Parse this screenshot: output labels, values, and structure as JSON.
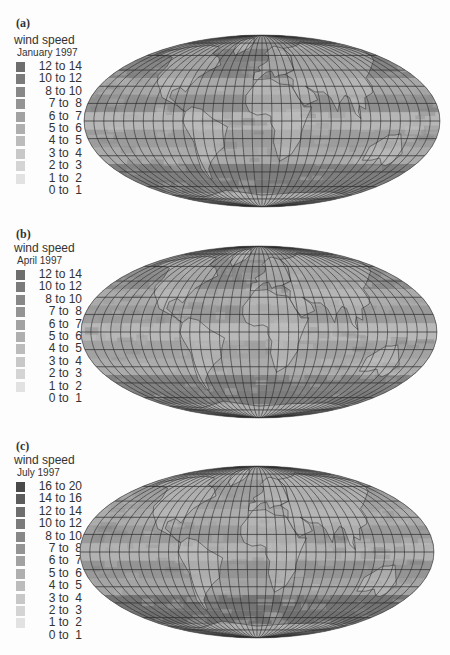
{
  "figure": {
    "panels": [
      {
        "label": "(a)",
        "legend_title": "wind speed",
        "legend_subtitle": "January 1997",
        "legend_items": [
          {
            "range": "12 to 14",
            "color": "#6e6e6e"
          },
          {
            "range": "10 to 12",
            "color": "#7b7b7b"
          },
          {
            "range": " 8 to 10",
            "color": "#888888"
          },
          {
            "range": " 7 to  8",
            "color": "#949494"
          },
          {
            "range": " 6 to  7",
            "color": "#a2a2a2"
          },
          {
            "range": " 5 to  6",
            "color": "#afafaf"
          },
          {
            "range": " 4 to  5",
            "color": "#bcbcbc"
          },
          {
            "range": " 3 to  4",
            "color": "#c8c8c8"
          },
          {
            "range": " 2 to  3",
            "color": "#d4d4d4"
          },
          {
            "range": " 1 to  2",
            "color": "#e2e2e2"
          },
          {
            "range": " 0 to  1",
            "color": "#fdfdfd"
          }
        ]
      },
      {
        "label": "(b)",
        "legend_title": "wind speed",
        "legend_subtitle": "April 1997",
        "legend_items": [
          {
            "range": "12 to 14",
            "color": "#6e6e6e"
          },
          {
            "range": "10 to 12",
            "color": "#7b7b7b"
          },
          {
            "range": " 8 to 10",
            "color": "#888888"
          },
          {
            "range": " 7 to  8",
            "color": "#949494"
          },
          {
            "range": " 6 to  7",
            "color": "#a2a2a2"
          },
          {
            "range": " 5 to  6",
            "color": "#afafaf"
          },
          {
            "range": " 4 to  5",
            "color": "#bcbcbc"
          },
          {
            "range": " 3 to  4",
            "color": "#c8c8c8"
          },
          {
            "range": " 2 to  3",
            "color": "#d4d4d4"
          },
          {
            "range": " 1 to  2",
            "color": "#e2e2e2"
          },
          {
            "range": " 0 to  1",
            "color": "#fdfdfd"
          }
        ]
      },
      {
        "label": "(c)",
        "legend_title": "wind speed",
        "legend_subtitle": "July 1997",
        "legend_items": [
          {
            "range": "16 to 20",
            "color": "#4a4a4a"
          },
          {
            "range": "14 to 16",
            "color": "#5c5c5c"
          },
          {
            "range": "12 to 14",
            "color": "#6e6e6e"
          },
          {
            "range": "10 to 12",
            "color": "#7b7b7b"
          },
          {
            "range": " 8 to 10",
            "color": "#888888"
          },
          {
            "range": " 7 to  8",
            "color": "#949494"
          },
          {
            "range": " 6 to  7",
            "color": "#a2a2a2"
          },
          {
            "range": " 5 to  6",
            "color": "#afafaf"
          },
          {
            "range": " 4 to  5",
            "color": "#bcbcbc"
          },
          {
            "range": " 3 to  4",
            "color": "#c8c8c8"
          },
          {
            "range": " 2 to  3",
            "color": "#d4d4d4"
          },
          {
            "range": " 1 to  2",
            "color": "#e2e2e2"
          },
          {
            "range": " 0 to  1",
            "color": "#fdfdfd"
          }
        ]
      }
    ]
  },
  "maps": [
    {
      "month": "January 1997",
      "projection": "Mollweide world map",
      "cx": 262,
      "cy": 121,
      "rx": 178,
      "ry": 86,
      "bands": [
        {
          "lat": 75,
          "color": "#9a9a9a"
        },
        {
          "lat": 60,
          "color": "#7e7e7e"
        },
        {
          "lat": 45,
          "color": "#858585"
        },
        {
          "lat": 30,
          "color": "#a8a8a8"
        },
        {
          "lat": 15,
          "color": "#8f8f8f"
        },
        {
          "lat": 0,
          "color": "#b6b6b6"
        },
        {
          "lat": -15,
          "color": "#9c9c9c"
        },
        {
          "lat": -30,
          "color": "#aaaaaa"
        },
        {
          "lat": -45,
          "color": "#7e7e7e"
        },
        {
          "lat": -60,
          "color": "#7a7a7a"
        },
        {
          "lat": -75,
          "color": "#9a9a9a"
        }
      ]
    },
    {
      "month": "April 1997",
      "projection": "Mollweide world map",
      "cx": 259,
      "cy": 332,
      "rx": 178,
      "ry": 86,
      "bands": [
        {
          "lat": 75,
          "color": "#a0a0a0"
        },
        {
          "lat": 60,
          "color": "#8e8e8e"
        },
        {
          "lat": 45,
          "color": "#8a8a8a"
        },
        {
          "lat": 30,
          "color": "#aaaaaa"
        },
        {
          "lat": 15,
          "color": "#9a9a9a"
        },
        {
          "lat": 0,
          "color": "#b8b8b8"
        },
        {
          "lat": -15,
          "color": "#a2a2a2"
        },
        {
          "lat": -30,
          "color": "#ababab"
        },
        {
          "lat": -45,
          "color": "#828282"
        },
        {
          "lat": -60,
          "color": "#7c7c7c"
        },
        {
          "lat": -75,
          "color": "#9c9c9c"
        }
      ]
    },
    {
      "month": "July 1997",
      "projection": "Mollweide world map",
      "cx": 257,
      "cy": 552,
      "rx": 177,
      "ry": 86,
      "bands": [
        {
          "lat": 75,
          "color": "#a8a8a8"
        },
        {
          "lat": 60,
          "color": "#9c9c9c"
        },
        {
          "lat": 45,
          "color": "#a0a0a0"
        },
        {
          "lat": 30,
          "color": "#acacac"
        },
        {
          "lat": 15,
          "color": "#9a9a9a"
        },
        {
          "lat": 0,
          "color": "#b2b2b2"
        },
        {
          "lat": -15,
          "color": "#949494"
        },
        {
          "lat": -30,
          "color": "#a4a4a4"
        },
        {
          "lat": -45,
          "color": "#747474"
        },
        {
          "lat": -60,
          "color": "#707070"
        },
        {
          "lat": -75,
          "color": "#969696"
        }
      ]
    }
  ],
  "chart_data": [
    {
      "type": "heatmap",
      "title": "wind speed January 1997",
      "panel": "(a)",
      "legend": [
        "12 to 14",
        "10 to 12",
        "8 to 10",
        "7 to 8",
        "6 to 7",
        "5 to 6",
        "4 to 5",
        "3 to 4",
        "2 to 3",
        "1 to 2",
        "0 to 1"
      ]
    },
    {
      "type": "heatmap",
      "title": "wind speed April 1997",
      "panel": "(b)",
      "legend": [
        "12 to 14",
        "10 to 12",
        "8 to 10",
        "7 to 8",
        "6 to 7",
        "5 to 6",
        "4 to 5",
        "3 to 4",
        "2 to 3",
        "1 to 2",
        "0 to 1"
      ]
    },
    {
      "type": "heatmap",
      "title": "wind speed July 1997",
      "panel": "(c)",
      "legend": [
        "16 to 20",
        "14 to 16",
        "12 to 14",
        "10 to 12",
        "8 to 10",
        "7 to 8",
        "6 to 7",
        "5 to 6",
        "4 to 5",
        "3 to 4",
        "2 to 3",
        "1 to 2",
        "0 to 1"
      ]
    }
  ]
}
